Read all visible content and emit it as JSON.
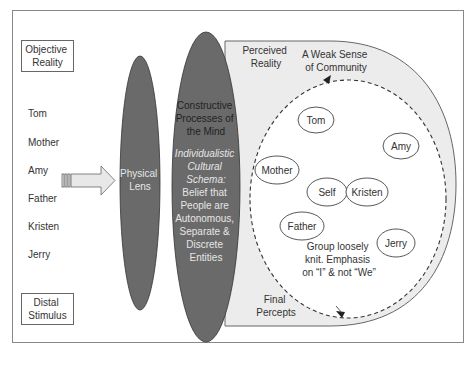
{
  "left_panel": {
    "objective_reality_label_line1": "Objective",
    "objective_reality_label_line2": "Reality",
    "distal_stimulus_line1": "Distal",
    "distal_stimulus_line2": "Stimulus",
    "people": [
      "Tom",
      "Mother",
      "Amy",
      "Father",
      "Kristen",
      "Jerry"
    ]
  },
  "physical_lens": {
    "line1": "Physical",
    "line2": "Lens"
  },
  "mind": {
    "title_lines": [
      "Constructive",
      "Processes of",
      "the Mind"
    ],
    "schema_italic_lines": [
      "Individualistic",
      "Cultural",
      "Schema:"
    ],
    "schema_plain_lines": [
      "Belief that",
      "People are",
      "Autonomous,",
      "Separate &",
      "Discrete",
      "Entities"
    ]
  },
  "perceived": {
    "label_line1": "Perceived",
    "label_line2": "Reality",
    "community_line1": "A Weak Sense",
    "community_line2": "of Community",
    "final_line1": "Final",
    "final_line2": "Percepts",
    "group_note_lines": [
      "Group loosely",
      "knit. Emphasis",
      "on “I” & not “We”"
    ],
    "nodes": {
      "tom": "Tom",
      "amy": "Amy",
      "mother": "Mother",
      "self": "Self",
      "kristen": "Kristen",
      "father": "Father",
      "jerry": "Jerry"
    }
  },
  "colors": {
    "lens_fill": "#6a6a6a",
    "perceived_fill": "#ececec",
    "frame_stroke": "#777777",
    "text_dark": "#333333",
    "text_light": "#e6e6e6"
  }
}
